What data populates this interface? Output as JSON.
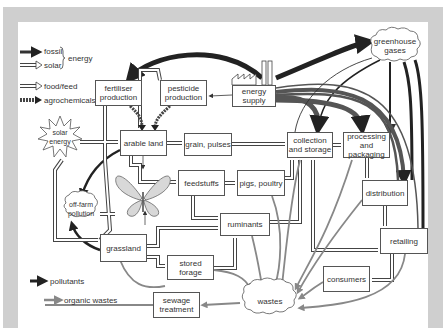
{
  "legend": {
    "energy_group_label": "energy",
    "items": [
      {
        "label": "fossil",
        "style": "fossil"
      },
      {
        "label": "solar",
        "style": "solar"
      },
      {
        "label": "food/feed",
        "style": "food"
      },
      {
        "label": "agrochemicals",
        "style": "agrochem"
      }
    ],
    "bottom_items": [
      {
        "label": "pollutants",
        "style": "pollutant"
      },
      {
        "label": "organic wastes",
        "style": "organic"
      }
    ]
  },
  "nodes": {
    "fertiliser": "fertiliser production",
    "pesticide": "pesticide production",
    "energy_supply": "energy supply",
    "greenhouse": "greenhouse gases",
    "solar_energy": "solar energy",
    "arable_land": "arable land",
    "grain": "grain, pulses",
    "collection": "collection and storage",
    "processing": "processing and packaging",
    "feedstuffs": "feedstuffs",
    "pigs": "pigs, poultry",
    "distribution": "distribution",
    "off_farm": "off-farm pollution",
    "ruminants": "ruminants",
    "grassland": "grassland",
    "retailing": "retailing",
    "stored_forage": "stored forage",
    "consumers": "consumers",
    "wastes": "wastes",
    "sewage": "sewage treatment"
  },
  "colors": {
    "frame": "#cfcfcf",
    "fossil": "#222222",
    "organic": "#888888",
    "box_border": "#555555",
    "text": "#333333"
  }
}
